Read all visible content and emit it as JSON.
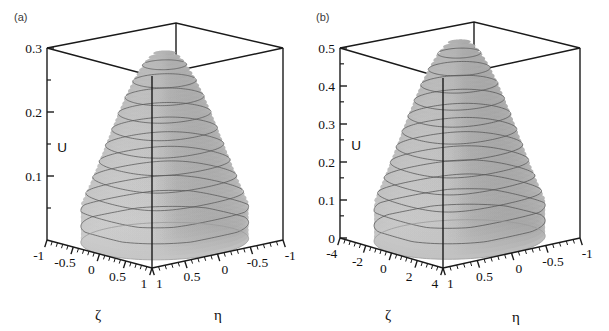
{
  "figure": {
    "background": "#ffffff",
    "width": 609,
    "height": 331,
    "panel_count": 2
  },
  "panels": [
    {
      "key": "a",
      "label": "(a)",
      "vertical_axis": {
        "name": "U",
        "ticks": [
          "0.1",
          "0.2",
          "0.3"
        ],
        "range": [
          0,
          0.3
        ],
        "minor_per_major": 1
      },
      "left_axis": {
        "name": "ζ",
        "ticks": [
          "-1",
          "-0.5",
          "0",
          "0.5",
          "1"
        ],
        "values": [
          -1,
          -0.5,
          0,
          0.5,
          1
        ],
        "minor_per_major": 5
      },
      "right_axis": {
        "name": "η",
        "ticks": [
          "1",
          "0.5",
          "0",
          "-0.5",
          "-1"
        ],
        "values": [
          1,
          0.5,
          0,
          -0.5,
          -1
        ],
        "minor_per_major": 5
      },
      "surface": {
        "peak": 0.3,
        "contour_count": 11,
        "light_face": "#d8d8d8",
        "dark_face": "#8e8e8e",
        "contour_color": "#5a5a5a"
      }
    },
    {
      "key": "b",
      "label": "(b)",
      "vertical_axis": {
        "name": "U",
        "ticks": [
          "0",
          "0.1",
          "0.2",
          "0.3",
          "0.4",
          "0.5"
        ],
        "range": [
          0,
          0.5
        ],
        "minor_per_major": 1
      },
      "left_axis": {
        "name": "ζ",
        "ticks": [
          "-4",
          "-2",
          "0",
          "2",
          "4"
        ],
        "values": [
          -4,
          -2,
          0,
          2,
          4
        ],
        "minor_per_major": 5
      },
      "right_axis": {
        "name": "η",
        "ticks": [
          "1",
          "0.5",
          "0",
          "-0.5",
          "-1"
        ],
        "values": [
          1,
          0.5,
          0,
          -0.5,
          -1
        ],
        "minor_per_major": 5
      },
      "surface": {
        "peak": 0.52,
        "contour_count": 12,
        "light_face": "#d4d4d4",
        "dark_face": "#8a8a8a",
        "contour_color": "#555555"
      }
    }
  ],
  "chart_data": [
    {
      "type": "surface",
      "panel": "(a)",
      "title": "",
      "xlabel": "ζ",
      "ylabel": "η",
      "zlabel": "U",
      "xlim": [
        -1,
        1
      ],
      "ylim": [
        -1,
        1
      ],
      "zlim": [
        0,
        0.3
      ],
      "xticks": [
        -1,
        -0.5,
        0,
        0.5,
        1
      ],
      "yticks": [
        1,
        0.5,
        0,
        -0.5,
        -1
      ],
      "zticks": [
        0.1,
        0.2,
        0.3
      ],
      "grid": false,
      "legend": "none",
      "description": "Single smooth dome peaking at U = 0.3 at the centre (ζ=0, η=0) and falling to zero on all four edges of the square domain; level-curve contours drawn on the surface.",
      "peak_value": 0.3,
      "peak_location": {
        "zeta": 0,
        "eta": 0
      },
      "contour_levels": [
        0.025,
        0.05,
        0.075,
        0.1,
        0.125,
        0.15,
        0.175,
        0.2,
        0.225,
        0.25,
        0.275
      ],
      "z_profile_along_zeta_at_eta0": {
        "zeta": [
          -1,
          -0.75,
          -0.5,
          -0.25,
          0,
          0.25,
          0.5,
          0.75,
          1
        ],
        "U": [
          0,
          0.13,
          0.235,
          0.29,
          0.3,
          0.29,
          0.235,
          0.13,
          0
        ]
      },
      "z_profile_along_eta_at_zeta0": {
        "eta": [
          -1,
          -0.75,
          -0.5,
          -0.25,
          0,
          0.25,
          0.5,
          0.75,
          1
        ],
        "U": [
          0,
          0.13,
          0.235,
          0.29,
          0.3,
          0.29,
          0.235,
          0.13,
          0
        ]
      }
    },
    {
      "type": "surface",
      "panel": "(b)",
      "title": "",
      "xlabel": "ζ",
      "ylabel": "η",
      "zlabel": "U",
      "xlim": [
        -5,
        5
      ],
      "ylim": [
        -1,
        1
      ],
      "zlim": [
        0,
        0.5
      ],
      "xticks": [
        -4,
        -2,
        0,
        2,
        4
      ],
      "yticks": [
        1,
        0.5,
        0,
        -0.5,
        -1
      ],
      "zticks": [
        0,
        0.1,
        0.2,
        0.3,
        0.4,
        0.5
      ],
      "grid": false,
      "legend": "none",
      "description": "Single smooth dome peaking near U = 0.52, slightly exceeding the 0.5 box top; broader and flatter along ζ (range -5..5) than along η, falling to zero on the domain edges.",
      "peak_value": 0.52,
      "peak_location": {
        "zeta": 0,
        "eta": 0
      },
      "contour_levels": [
        0.04,
        0.08,
        0.12,
        0.16,
        0.2,
        0.24,
        0.28,
        0.32,
        0.36,
        0.4,
        0.44,
        0.48
      ],
      "z_profile_along_zeta_at_eta0": {
        "zeta": [
          -5,
          -3.75,
          -2.5,
          -1.25,
          0,
          1.25,
          2.5,
          3.75,
          5
        ],
        "U": [
          0,
          0.23,
          0.41,
          0.5,
          0.52,
          0.5,
          0.41,
          0.23,
          0
        ]
      },
      "z_profile_along_eta_at_zeta0": {
        "eta": [
          -1,
          -0.75,
          -0.5,
          -0.25,
          0,
          0.25,
          0.5,
          0.75,
          1
        ],
        "U": [
          0,
          0.23,
          0.41,
          0.5,
          0.52,
          0.5,
          0.41,
          0.23,
          0
        ]
      }
    }
  ]
}
